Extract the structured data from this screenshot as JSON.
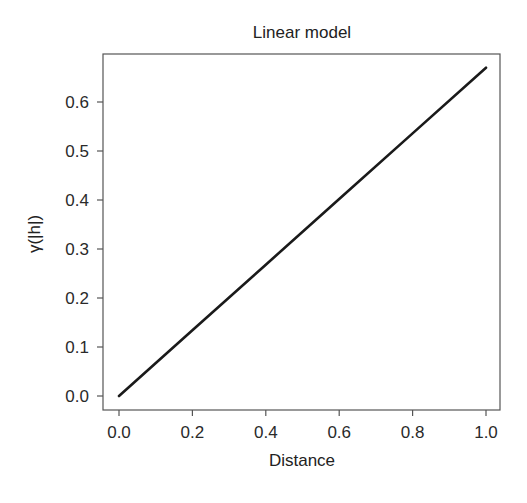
{
  "chart_data": {
    "type": "line",
    "title": "Linear model",
    "xlabel": "Distance",
    "ylabel": "γ(|h|)",
    "xlim": [
      0.0,
      1.0
    ],
    "ylim": [
      0.0,
      0.67
    ],
    "x_ticks": [
      "0.0",
      "0.2",
      "0.4",
      "0.6",
      "0.8",
      "1.0"
    ],
    "y_ticks": [
      "0.0",
      "0.1",
      "0.2",
      "0.3",
      "0.4",
      "0.5",
      "0.6"
    ],
    "grid": false,
    "legend": null,
    "series": [
      {
        "name": "Linear model",
        "color": "#1a1a1a",
        "x": [
          0.0,
          0.2,
          0.4,
          0.6,
          0.8,
          1.0
        ],
        "y": [
          0.0,
          0.134,
          0.268,
          0.402,
          0.536,
          0.67
        ]
      }
    ]
  },
  "plot": {
    "frame_color": "#555555",
    "line_color": "#1a1a1a"
  }
}
